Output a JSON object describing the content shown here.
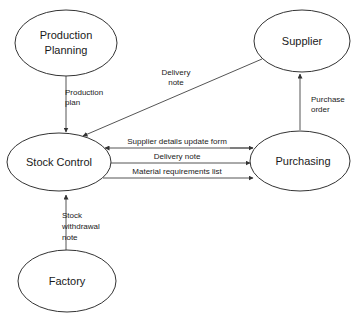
{
  "diagram": {
    "type": "data-flow-diagram",
    "canvas": {
      "width": 359,
      "height": 322,
      "background": "#ffffff"
    },
    "style": {
      "node_stroke": "#333333",
      "line_stroke": "#555555",
      "text_color": "#1a1a1a"
    },
    "nodes": [
      {
        "id": "production-planning",
        "label_line1": "Production",
        "label_line2": "Planning",
        "cx": 66,
        "cy": 43,
        "rx": 51,
        "ry": 33
      },
      {
        "id": "supplier",
        "label_line1": "Supplier",
        "label_line2": "",
        "cx": 302,
        "cy": 41,
        "rx": 48,
        "ry": 31
      },
      {
        "id": "stock-control",
        "label_line1": "Stock Control",
        "label_line2": "",
        "cx": 59,
        "cy": 162,
        "rx": 52,
        "ry": 29
      },
      {
        "id": "purchasing",
        "label_line1": "Purchasing",
        "label_line2": "",
        "cx": 300,
        "cy": 161,
        "rx": 50,
        "ry": 30
      },
      {
        "id": "factory",
        "label_line1": "Factory",
        "label_line2": "",
        "cx": 67,
        "cy": 281,
        "rx": 49,
        "ry": 31
      }
    ],
    "flows": [
      {
        "id": "production-plan",
        "label_line1": "Production",
        "label_line2": "plan",
        "from": "production-planning",
        "to": "stock-control",
        "label_x": 65,
        "label_y1": 95,
        "label_y2": 105
      },
      {
        "id": "delivery-note-supplier",
        "label_line1": "Delivery",
        "label_line2": "note",
        "from": "supplier",
        "to": "stock-control",
        "label_x": 176,
        "label_y1": 75,
        "label_y2": 85
      },
      {
        "id": "purchase-order",
        "label_line1": "Purchase",
        "label_line2": "order",
        "from": "purchasing",
        "to": "supplier",
        "label_x": 311,
        "label_y1": 102,
        "label_y2": 112
      },
      {
        "id": "supplier-details-update-form",
        "label_line1": "Supplier details update form",
        "label_line2": "",
        "from": "purchasing",
        "to": "stock-control",
        "label_x": 177,
        "label_y1": 144,
        "label_y2": 0
      },
      {
        "id": "delivery-note-purchasing",
        "label_line1": "Delivery note",
        "label_line2": "",
        "from": "stock-control",
        "to": "purchasing",
        "label_x": 177,
        "label_y1": 159,
        "label_y2": 0
      },
      {
        "id": "material-requirements-list",
        "label_line1": "Material requirements list",
        "label_line2": "",
        "from": "stock-control",
        "to": "purchasing",
        "label_x": 177,
        "label_y1": 174,
        "label_y2": 0
      },
      {
        "id": "stock-withdrawal-note",
        "label_line1": "Stock",
        "label_line2": "withdrawal",
        "label_line3": "note",
        "from": "factory",
        "to": "stock-control",
        "label_x": 62,
        "label_y1": 218,
        "label_y2": 229,
        "label_y3": 240
      }
    ]
  }
}
